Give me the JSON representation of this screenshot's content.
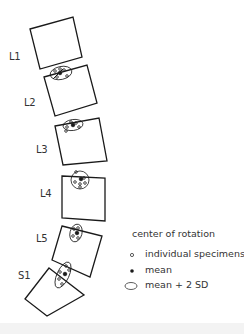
{
  "labels": {
    "L1": "L1",
    "L2": "L2",
    "L3": "L3",
    "L4": "L4",
    "L5": "L5",
    "S1": "S1"
  },
  "legend": {
    "title": "center of rotation",
    "items": [
      {
        "icon": "hollow-dot-icon",
        "label": "individual specimens"
      },
      {
        "icon": "filled-dot-icon",
        "label": "mean"
      },
      {
        "icon": "ellipse-icon",
        "label": "mean + 2 SD"
      }
    ]
  },
  "colors": {
    "stroke": "#1a1a1a",
    "text": "#333333",
    "background": "#ffffff"
  }
}
